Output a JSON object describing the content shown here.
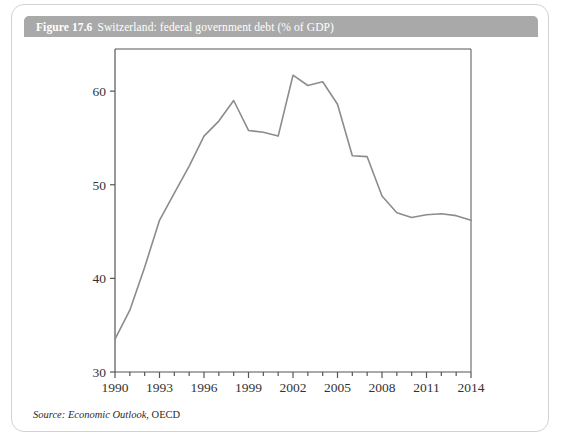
{
  "figure": {
    "number": "Figure 17.6",
    "title": "Switzerland: federal government debt (% of GDP)",
    "source_label": "Source:",
    "source_publication": "Economic Outlook",
    "source_org": ", OECD"
  },
  "colors": {
    "title_bar": "#a9a9a9",
    "title_text": "#ffffff",
    "card_border": "#d2d2d2",
    "axis": "#555555",
    "line": "#8c8c8c",
    "plot_background": "#ffffff"
  },
  "chart_data": {
    "type": "line",
    "title": "Switzerland: federal government debt (% of GDP)",
    "xlabel": "",
    "ylabel": "",
    "grid": false,
    "legend": "none",
    "xlim": [
      1990,
      2014
    ],
    "ylim": [
      30,
      64.5
    ],
    "yticks": [
      30,
      40,
      50,
      60
    ],
    "ytick_labels": [
      "30",
      "40",
      "50",
      "60"
    ],
    "xticks": [
      1990,
      1991,
      1992,
      1993,
      1994,
      1995,
      1996,
      1997,
      1998,
      1999,
      2000,
      2001,
      2002,
      2003,
      2004,
      2005,
      2006,
      2007,
      2008,
      2009,
      2010,
      2011,
      2012,
      2013,
      2014
    ],
    "xtick_labels_shown": [
      "1990",
      "1993",
      "1996",
      "1999",
      "2002",
      "2005",
      "2008",
      "2011",
      "2014"
    ],
    "x": [
      1990,
      1991,
      1992,
      1993,
      1994,
      1995,
      1996,
      1997,
      1998,
      1999,
      2000,
      2001,
      2002,
      2003,
      2004,
      2005,
      2006,
      2007,
      2008,
      2009,
      2010,
      2011,
      2012,
      2013,
      2014
    ],
    "series": [
      {
        "name": "Federal government debt (% of GDP)",
        "values": [
          33.5,
          36.6,
          41.2,
          46.2,
          49.1,
          52.0,
          55.2,
          56.8,
          59.0,
          55.8,
          55.6,
          55.2,
          61.7,
          60.6,
          61.0,
          58.6,
          53.1,
          53.0,
          48.8,
          47.0,
          46.5,
          46.8,
          46.9,
          46.7,
          46.2
        ]
      }
    ]
  }
}
